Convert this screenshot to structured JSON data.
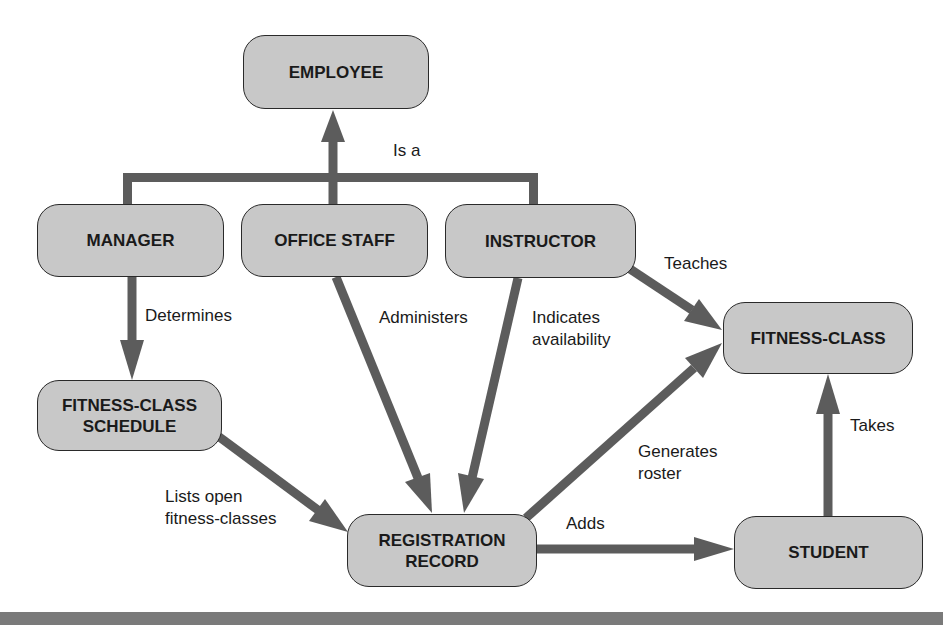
{
  "diagram": {
    "type": "entity-relationship concept map",
    "colors": {
      "node_fill": "#c8c8c8",
      "node_border": "#2a2a2a",
      "edge": "#5c5c5c",
      "text": "#1a1a1a",
      "footer_bar": "#7a7a7a"
    },
    "nodes": {
      "employee": "EMPLOYEE",
      "manager": "MANAGER",
      "office_staff": "OFFICE STAFF",
      "instructor": "INSTRUCTOR",
      "fitness_class": "FITNESS-CLASS",
      "fitness_class_schedule": "FITNESS-CLASS\nSCHEDULE",
      "registration_record": "REGISTRATION\nRECORD",
      "student": "STUDENT"
    },
    "edges": [
      {
        "from": "manager",
        "to": "employee",
        "label": "Is a"
      },
      {
        "from": "office_staff",
        "to": "employee",
        "label": "Is a"
      },
      {
        "from": "instructor",
        "to": "employee",
        "label": "Is a"
      },
      {
        "from": "manager",
        "to": "fitness_class_schedule",
        "label": "Determines"
      },
      {
        "from": "office_staff",
        "to": "registration_record",
        "label": "Administers"
      },
      {
        "from": "instructor",
        "to": "registration_record",
        "label": "Indicates\navailability"
      },
      {
        "from": "instructor",
        "to": "fitness_class",
        "label": "Teaches"
      },
      {
        "from": "fitness_class_schedule",
        "to": "registration_record",
        "label": "Lists open\nfitness-classes"
      },
      {
        "from": "registration_record",
        "to": "fitness_class",
        "label": "Generates\nroster"
      },
      {
        "from": "registration_record",
        "to": "student",
        "label": "Adds"
      },
      {
        "from": "student",
        "to": "fitness_class",
        "label": "Takes"
      }
    ],
    "labels": {
      "is_a": "Is a",
      "determines": "Determines",
      "administers": "Administers",
      "indicates_availability": "Indicates\navailability",
      "teaches": "Teaches",
      "lists_open": "Lists open\nfitness-classes",
      "generates_roster": "Generates\nroster",
      "adds": "Adds",
      "takes": "Takes"
    }
  }
}
